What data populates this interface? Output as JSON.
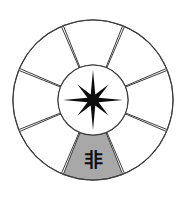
{
  "diagram": {
    "type": "radial-sector-wheel",
    "background_color": "#ffffff",
    "stroke_color": "#3c3c3c",
    "highlight_color": "#a8a8a8",
    "glyph_color": "#0d0d0d",
    "geometry": {
      "center_x": 93,
      "center_y": 100,
      "outer_radius": 80,
      "inner_radius": 35,
      "sector_count": 8,
      "sector_span_degrees": 45,
      "sector_gap_degrees": 1.5,
      "rotation_offset_degrees": 22.5
    },
    "hub": {
      "radius": 35,
      "fill": "#ffffff",
      "star": {
        "name": "eight-point-compass-star",
        "points": 8,
        "outer_radius_long": 30,
        "outer_radius_short": 22,
        "inner_radius": 6,
        "fill": "#0d0d0d"
      }
    },
    "sectors": [
      {
        "id": "sector-n",
        "label": "",
        "center_angle_degrees": 270,
        "fill": "#ffffff",
        "highlighted": false
      },
      {
        "id": "sector-ne",
        "label": "",
        "center_angle_degrees": 315,
        "fill": "#ffffff",
        "highlighted": false
      },
      {
        "id": "sector-e",
        "label": "",
        "center_angle_degrees": 0,
        "fill": "#ffffff",
        "highlighted": false
      },
      {
        "id": "sector-se",
        "label": "",
        "center_angle_degrees": 45,
        "fill": "#ffffff",
        "highlighted": false
      },
      {
        "id": "sector-s",
        "label": "非",
        "center_angle_degrees": 90,
        "fill": "#a8a8a8",
        "highlighted": true
      },
      {
        "id": "sector-sw",
        "label": "",
        "center_angle_degrees": 135,
        "fill": "#ffffff",
        "highlighted": false
      },
      {
        "id": "sector-w",
        "label": "",
        "center_angle_degrees": 180,
        "fill": "#ffffff",
        "highlighted": false
      },
      {
        "id": "sector-nw",
        "label": "",
        "center_angle_degrees": 225,
        "fill": "#ffffff",
        "highlighted": false
      }
    ]
  }
}
